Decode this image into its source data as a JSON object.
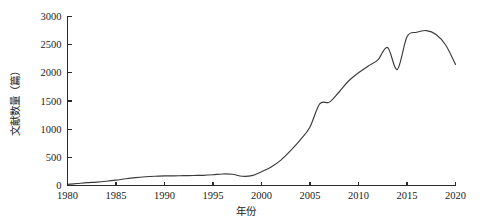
{
  "chart_data": {
    "type": "line",
    "title": "",
    "subtitle": "",
    "xlabel": "年份",
    "ylabel": "文献数量（篇）",
    "xlim": [
      1980,
      2020
    ],
    "ylim": [
      0,
      3000
    ],
    "xticks": [
      1980,
      1985,
      1990,
      1995,
      2000,
      2005,
      2010,
      2015,
      2020
    ],
    "yticks": [
      0,
      500,
      1000,
      1500,
      2000,
      2500,
      3000
    ],
    "xtick_labels": [
      "1980",
      "1985",
      "1990",
      "1995",
      "2000",
      "2005",
      "2010",
      "2015",
      "2020"
    ],
    "ytick_labels": [
      "0",
      "500",
      "1000",
      "1500",
      "2000",
      "2500",
      "3000"
    ],
    "grid": false,
    "legend": false,
    "legend_position": "none",
    "line_color": "#3a3a3a",
    "axis_color": "#2a2a2a",
    "background_color": "#ffffff",
    "x": [
      1980,
      1981,
      1982,
      1983,
      1984,
      1985,
      1986,
      1987,
      1988,
      1989,
      1990,
      1991,
      1992,
      1993,
      1994,
      1995,
      1996,
      1997,
      1998,
      1999,
      2000,
      2001,
      2002,
      2003,
      2004,
      2005,
      2006,
      2007,
      2008,
      2009,
      2010,
      2011,
      2012,
      2013,
      2014,
      2015,
      2016,
      2017,
      2018,
      2019,
      2020
    ],
    "values": [
      20,
      35,
      50,
      60,
      75,
      95,
      120,
      140,
      155,
      165,
      170,
      172,
      175,
      178,
      180,
      190,
      205,
      200,
      165,
      175,
      245,
      330,
      450,
      620,
      810,
      1040,
      1450,
      1480,
      1660,
      1860,
      2000,
      2120,
      2230,
      2450,
      2060,
      2640,
      2720,
      2750,
      2680,
      2490,
      2150
    ],
    "series": [
      {
        "name": "文献数量",
        "values": [
          20,
          35,
          50,
          60,
          75,
          95,
          120,
          140,
          155,
          165,
          170,
          172,
          175,
          178,
          180,
          190,
          205,
          200,
          165,
          175,
          245,
          330,
          450,
          620,
          810,
          1040,
          1450,
          1480,
          1660,
          1860,
          2000,
          2120,
          2230,
          2450,
          2060,
          2640,
          2720,
          2750,
          2680,
          2490,
          2150
        ]
      }
    ]
  }
}
